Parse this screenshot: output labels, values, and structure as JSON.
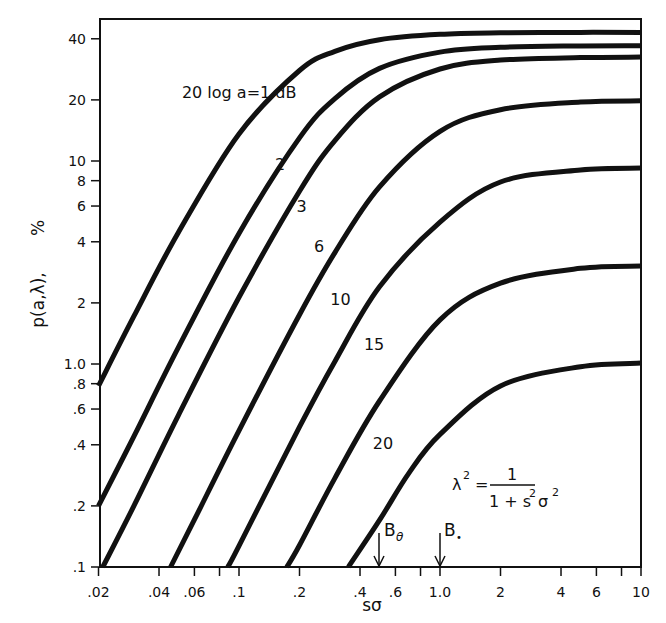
{
  "chart_data": {
    "type": "line",
    "title": "",
    "xlabel": "sσ",
    "ylabel": "p(a,λ),   %",
    "xscale": "log",
    "yscale": "log",
    "xlim": [
      0.02,
      10
    ],
    "ylim": [
      0.1,
      50
    ],
    "grid": false,
    "legend_position": "inline curve labels",
    "x_ticks": [
      {
        "value": 0.02,
        "label": ".02"
      },
      {
        "value": 0.04,
        "label": ".04"
      },
      {
        "value": 0.06,
        "label": ".06"
      },
      {
        "value": 0.08,
        "label": ""
      },
      {
        "value": 0.1,
        "label": ".1"
      },
      {
        "value": 0.2,
        "label": ".2"
      },
      {
        "value": 0.4,
        "label": ".4"
      },
      {
        "value": 0.6,
        "label": ".6"
      },
      {
        "value": 0.8,
        "label": ""
      },
      {
        "value": 1.0,
        "label": "1.0"
      },
      {
        "value": 2,
        "label": "2"
      },
      {
        "value": 4,
        "label": "4"
      },
      {
        "value": 6,
        "label": "6"
      },
      {
        "value": 8,
        "label": ""
      },
      {
        "value": 10,
        "label": "10"
      }
    ],
    "y_ticks": [
      {
        "value": 0.1,
        "label": ".1"
      },
      {
        "value": 0.2,
        "label": ".2"
      },
      {
        "value": 0.4,
        "label": ".4"
      },
      {
        "value": 0.6,
        "label": ".6"
      },
      {
        "value": 0.8,
        "label": ".8"
      },
      {
        "value": 1.0,
        "label": "1.0"
      },
      {
        "value": 2,
        "label": "2"
      },
      {
        "value": 4,
        "label": "4"
      },
      {
        "value": 6,
        "label": "6"
      },
      {
        "value": 8,
        "label": "8"
      },
      {
        "value": 10,
        "label": "10"
      },
      {
        "value": 20,
        "label": "20"
      },
      {
        "value": 40,
        "label": "40"
      }
    ],
    "series": [
      {
        "name": "1 dB",
        "label": "20 log a=1 dB",
        "x": [
          0.02,
          0.03,
          0.05,
          0.1,
          0.2,
          0.3,
          0.5,
          1,
          2,
          5,
          10
        ],
        "y": [
          0.78,
          1.72,
          4.46,
          13.6,
          27.9,
          34.7,
          39.6,
          42.1,
          42.8,
          43.0,
          43.0
        ]
      },
      {
        "name": "2 dB",
        "label": "2",
        "x": [
          0.02,
          0.03,
          0.05,
          0.1,
          0.2,
          0.3,
          0.5,
          1,
          2,
          5,
          10
        ],
        "y": [
          0.2,
          0.44,
          1.21,
          4.4,
          13.0,
          20.3,
          28.6,
          34.4,
          36.3,
          36.9,
          37.0
        ]
      },
      {
        "name": "3 dB",
        "label": "3",
        "x": [
          0.021,
          0.03,
          0.05,
          0.1,
          0.2,
          0.3,
          0.5,
          1,
          2,
          5,
          10
        ],
        "y": [
          0.1,
          0.2,
          0.56,
          2.13,
          7.1,
          12.6,
          20.7,
          28.4,
          31.4,
          32.3,
          32.5
        ]
      },
      {
        "name": "6 dB",
        "label": "6",
        "x": [
          0.0457,
          0.06,
          0.1,
          0.2,
          0.3,
          0.5,
          1,
          2,
          5,
          10
        ],
        "y": [
          0.1,
          0.171,
          0.47,
          1.75,
          3.54,
          7.46,
          14.0,
          17.9,
          19.5,
          19.8
        ]
      },
      {
        "name": "10 dB",
        "label": "10",
        "x": [
          0.088,
          0.1,
          0.2,
          0.3,
          0.5,
          1,
          2,
          5,
          10
        ],
        "y": [
          0.1,
          0.127,
          0.49,
          1.03,
          2.4,
          5.0,
          7.88,
          9.04,
          9.23
        ]
      },
      {
        "name": "15 dB",
        "label": "15",
        "x": [
          0.173,
          0.2,
          0.3,
          0.5,
          1,
          2,
          5,
          10
        ],
        "y": [
          0.1,
          0.128,
          0.274,
          0.657,
          1.65,
          2.5,
          2.96,
          3.04
        ]
      },
      {
        "name": "20 dB",
        "label": "20",
        "x": [
          0.35,
          0.5,
          0.7,
          1,
          2,
          5,
          10
        ],
        "y": [
          0.1,
          0.17,
          0.29,
          0.45,
          0.78,
          0.97,
          1.01
        ]
      }
    ],
    "curve_labels": [
      {
        "text": "20 log a=1 dB",
        "x": 0.052,
        "y": 20.5
      },
      {
        "text": "2",
        "x": 0.16,
        "y": 9.0
      },
      {
        "text": "3",
        "x": 0.205,
        "y": 5.6
      },
      {
        "text": "6",
        "x": 0.25,
        "y": 3.55
      },
      {
        "text": "10",
        "x": 0.32,
        "y": 1.95
      },
      {
        "text": "15",
        "x": 0.47,
        "y": 1.17
      },
      {
        "text": "20",
        "x": 0.52,
        "y": 0.38
      }
    ],
    "annotations": [
      {
        "text": "B_θ",
        "x": 0.5,
        "kind": "arrow"
      },
      {
        "text": "B_e",
        "x": 1.0,
        "kind": "arrow"
      },
      {
        "text": "λ² = 1 / (1 + s²σ²)",
        "kind": "formula"
      }
    ]
  },
  "labels": {
    "xlabel": "sσ",
    "ylabel": "p(a,λ),",
    "ylabel_unit": "%",
    "formula_lhs": "λ",
    "formula_lhs_sup": "2",
    "formula_eq": "=",
    "formula_num": "1",
    "formula_den_a": "1 + s",
    "formula_den_sup1": "2",
    "formula_den_b": "σ",
    "formula_den_sup2": "2",
    "marker_b_theta": "B",
    "marker_b_theta_sub": "θ",
    "marker_b_e": "B",
    "marker_b_e_sub": "•"
  }
}
